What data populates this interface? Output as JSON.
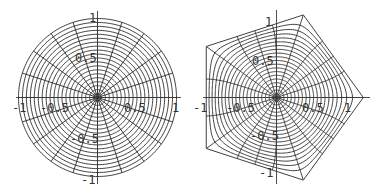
{
  "chart_data": [
    {
      "type": "line",
      "title": "",
      "description": "Polar grid of the unit disk: concentric circles and radial spokes",
      "rings": 20,
      "spokes": 20,
      "xlabel": "",
      "ylabel": "",
      "xlim": [
        -1,
        1
      ],
      "ylim": [
        -1,
        1
      ],
      "x_ticks": [
        "-1",
        "-0.5",
        "0.5",
        "1"
      ],
      "y_ticks": [
        "1",
        "0.5",
        "-0.5",
        "-1"
      ],
      "grid": false,
      "legend": null
    },
    {
      "type": "line",
      "title": "",
      "description": "Image of the same polar grid under a conformal map of the disk onto a regular pentagon",
      "rings": 20,
      "spokes": 20,
      "polygon_sides": 5,
      "xlabel": "",
      "ylabel": "",
      "xlim": [
        -1,
        1.2
      ],
      "ylim": [
        -1.1,
        1.1
      ],
      "x_ticks": [
        "-1",
        "-0.5",
        "0.5",
        "1"
      ],
      "y_ticks": [
        "1",
        "0.5",
        "-0.5",
        "-1"
      ],
      "grid": false,
      "legend": null
    }
  ],
  "plots": {
    "left": {
      "labels": {
        "x_neg1": "-1",
        "x_neg05": "-0.5",
        "x_pos05": "0.5",
        "x_pos1": "1",
        "y_pos1": "1",
        "y_pos05": "0.5",
        "y_neg05": "-0.5",
        "y_neg1": "-1"
      }
    },
    "right": {
      "labels": {
        "x_neg1": "-1",
        "x_neg05": "-0.5",
        "x_pos05": "0.5",
        "x_pos1": "1",
        "y_pos1": "1",
        "y_pos05": "0.5",
        "y_neg05": "-0.5",
        "y_neg1": "-1"
      }
    }
  },
  "style": {
    "line_color": "#2a2a2a",
    "background": "#ffffff"
  }
}
